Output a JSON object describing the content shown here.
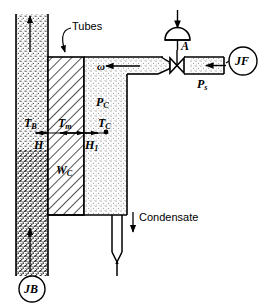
{
  "figure": {
    "type": "process-schematic",
    "background_color": "#ffffff",
    "line_color": "#000000"
  },
  "labels": {
    "tubes": "Tubes",
    "condensate": "Condensate",
    "omega": "ω",
    "valve_actuator": "A",
    "steam_supply_pressure": "P",
    "steam_supply_pressure_sub": "s",
    "flow_source": "JF",
    "bath_source": "JB",
    "temp_bath": "T",
    "temp_bath_sub": "B",
    "temp_metal": "T",
    "temp_metal_sub": "m",
    "temp_condenser": "T",
    "temp_condenser_sub": "C",
    "pressure_condenser": "P",
    "pressure_condenser_sub": "C",
    "height_h": "H",
    "height_h1": "H",
    "height_h1_sub": "1",
    "width_wc": "W",
    "width_wc_sub": "C"
  },
  "regions": [
    {
      "name": "bath-column",
      "fill": "stipple-dense",
      "x": 16,
      "y": 14,
      "w": 32,
      "h": 262
    },
    {
      "name": "tube-bundle",
      "fill": "diagonal-hatch",
      "x": 48,
      "y": 57,
      "w": 36,
      "h": 158
    },
    {
      "name": "condenser-shell",
      "fill": "stipple-light",
      "x": 84,
      "y": 57,
      "w": 43,
      "h": 158
    },
    {
      "name": "steam-header",
      "fill": "stipple-light",
      "x": 127,
      "y": 57,
      "w": 34,
      "h": 17
    },
    {
      "name": "steam-supply-pipe",
      "fill": "stipple-light",
      "x": 180,
      "y": 57,
      "w": 44,
      "h": 17
    }
  ],
  "annotations": {
    "bath_flow_direction": "up",
    "steam_flow_direction": "left",
    "condensate_flow_direction": "down",
    "dimension_h": "bath wall to tube bundle left face",
    "dimension_h1": "tube bundle right face to condenser",
    "valve_type": "diaphragm-actuated globe valve"
  }
}
